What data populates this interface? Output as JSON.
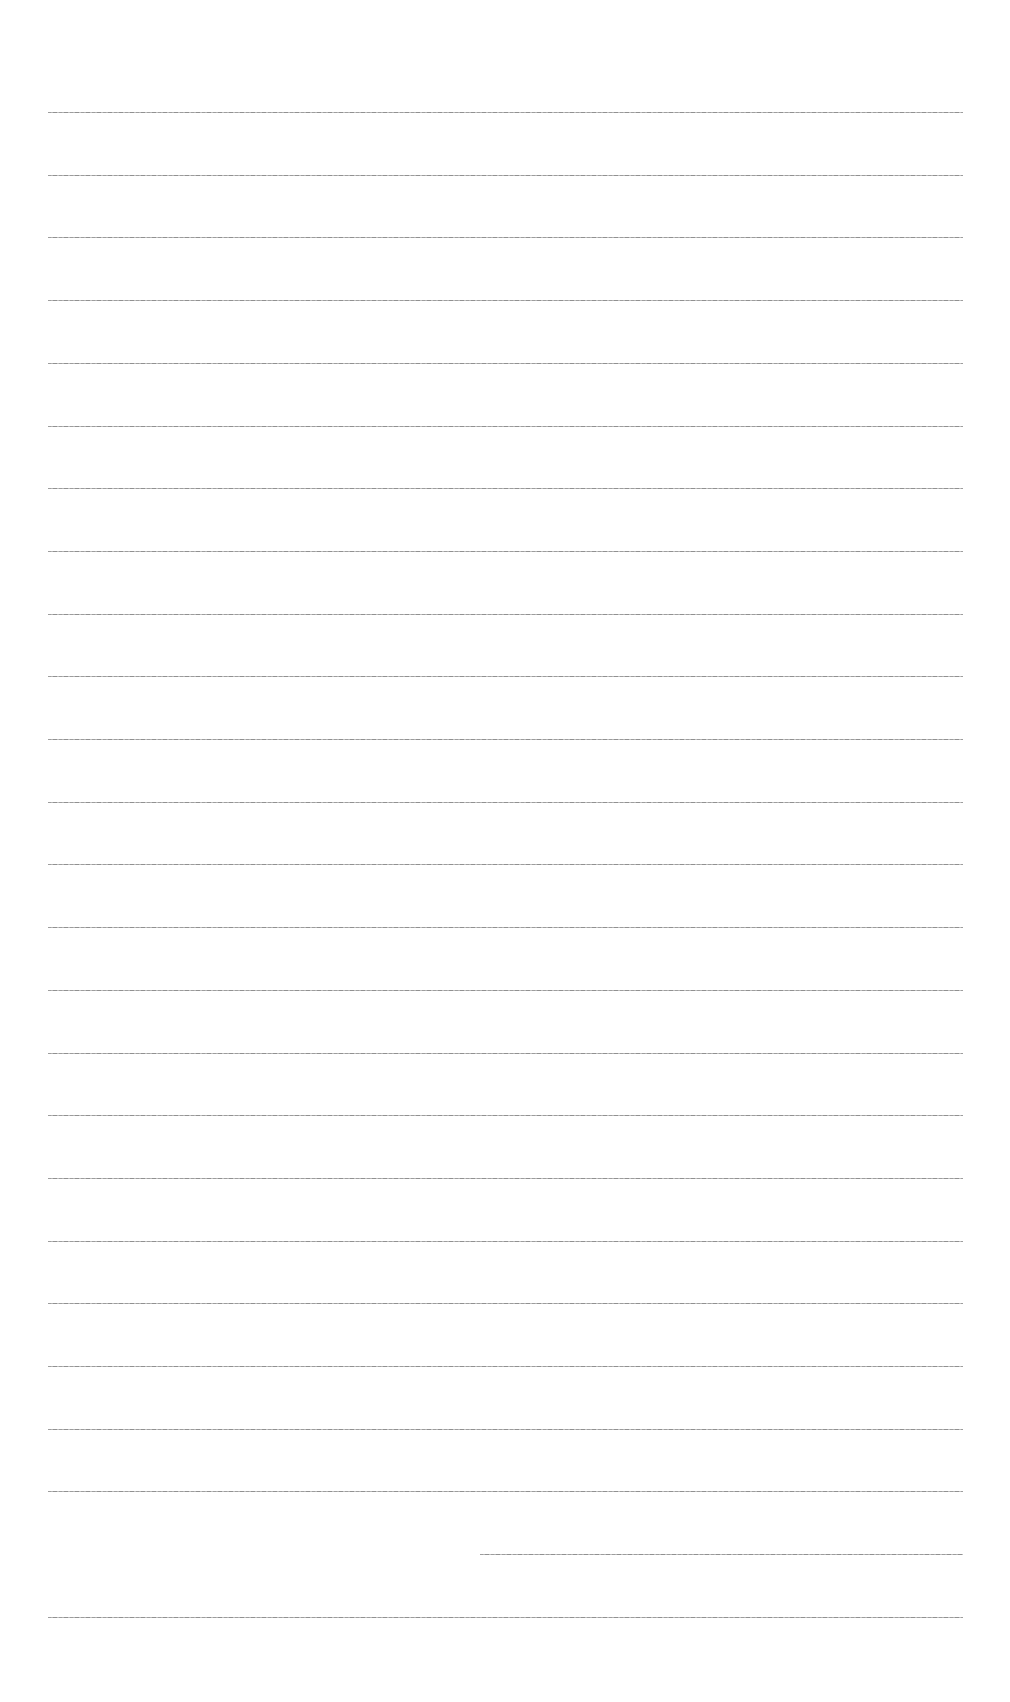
{
  "page": {
    "type": "ruled-blank-sheet",
    "background_color": "#ffffff",
    "rule_color": "#8c8c8c",
    "rule_count": 25,
    "rule_left_px": 48,
    "rule_right_px": 963,
    "first_rule_y_px": 112,
    "rule_spacing_px": 62.7,
    "rules": [
      {
        "index": 1
      },
      {
        "index": 2
      },
      {
        "index": 3
      },
      {
        "index": 4
      },
      {
        "index": 5
      },
      {
        "index": 6
      },
      {
        "index": 7
      },
      {
        "index": 8
      },
      {
        "index": 9
      },
      {
        "index": 10
      },
      {
        "index": 11
      },
      {
        "index": 12
      },
      {
        "index": 13
      },
      {
        "index": 14
      },
      {
        "index": 15
      },
      {
        "index": 16
      },
      {
        "index": 17
      },
      {
        "index": 18
      },
      {
        "index": 19
      },
      {
        "index": 20
      },
      {
        "index": 21
      },
      {
        "index": 22
      },
      {
        "index": 23
      },
      {
        "index": 24,
        "partial_start_px": 480
      },
      {
        "index": 25
      }
    ]
  }
}
